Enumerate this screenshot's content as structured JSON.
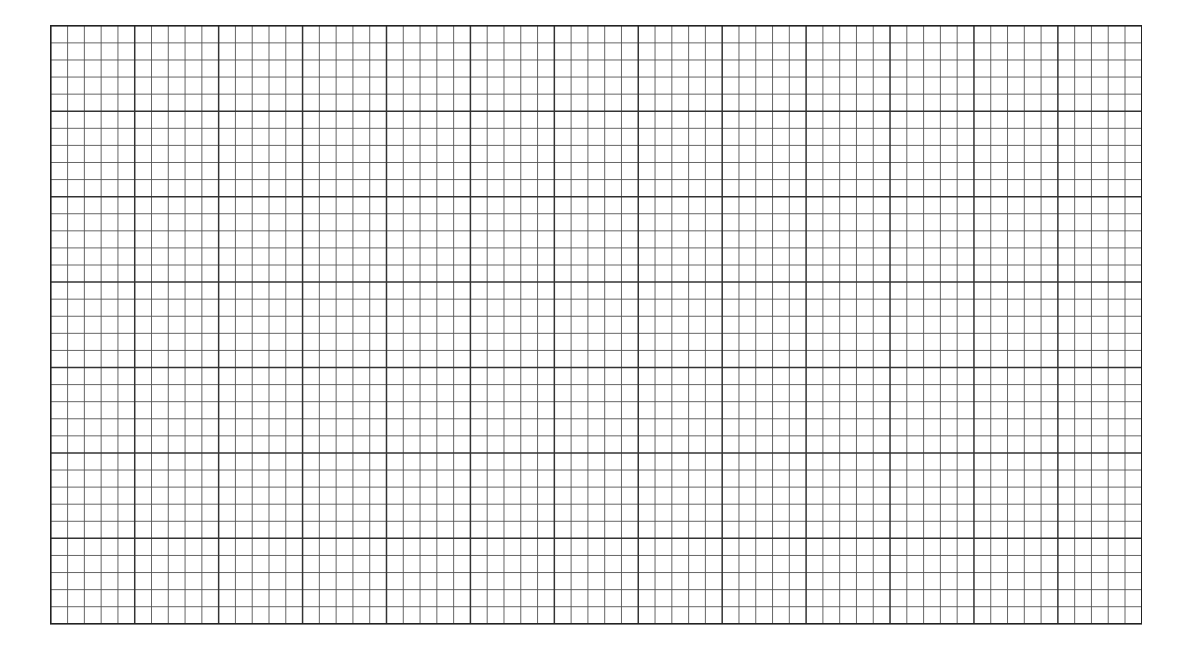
{
  "sheet": {
    "type": "graph paper",
    "background": "#ffffff",
    "line_color": "#333333",
    "minor_line_color": "#555555",
    "left": 50,
    "top": 25,
    "width": 1091,
    "height": 598,
    "major_columns": 13,
    "major_rows": 7,
    "minor_per_major": 5,
    "minor_columns": 65,
    "minor_rows": 35
  }
}
